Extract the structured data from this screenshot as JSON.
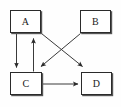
{
  "diagram": {
    "type": "directed-graph",
    "background_color": "#ffffff",
    "stroke_color": "#333333",
    "node_border_color": "#2b2b2b",
    "node_fill_color": "#ffffff",
    "node_shadow_color": "#555555",
    "nodes": [
      {
        "id": "A",
        "label": "A",
        "x": 10,
        "y": 10,
        "width": 31,
        "height": 23
      },
      {
        "id": "B",
        "label": "B",
        "x": 80,
        "y": 10,
        "width": 31,
        "height": 23
      },
      {
        "id": "C",
        "label": "C",
        "x": 10,
        "y": 72,
        "width": 32,
        "height": 23
      },
      {
        "id": "D",
        "label": "D",
        "x": 81,
        "y": 72,
        "width": 31,
        "height": 23
      }
    ],
    "edges": [
      {
        "id": "a-to-c",
        "from": "A",
        "to": "C",
        "style": "vertical-down",
        "arrowhead": "filled-triangle"
      },
      {
        "id": "c-to-a",
        "from": "C",
        "to": "A",
        "style": "vertical-up",
        "arrowhead": "filled-triangle"
      },
      {
        "id": "a-to-d",
        "from": "A",
        "to": "D",
        "style": "diagonal-down-right",
        "arrowhead": "filled-triangle"
      },
      {
        "id": "b-to-c",
        "from": "B",
        "to": "C",
        "style": "diagonal-down-left",
        "arrowhead": "filled-triangle"
      },
      {
        "id": "c-to-d",
        "from": "C",
        "to": "D",
        "style": "horizontal-right",
        "arrowhead": "filled-triangle"
      }
    ]
  }
}
